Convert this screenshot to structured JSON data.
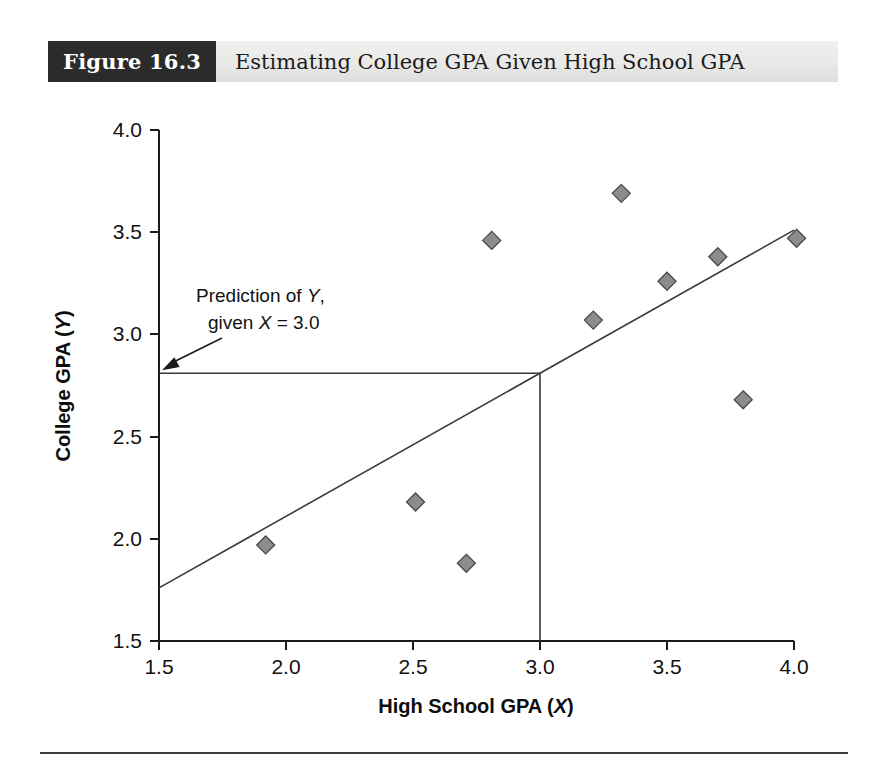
{
  "figure": {
    "number_label": "Figure 16.3",
    "caption": "Estimating College GPA Given High School GPA"
  },
  "colors": {
    "header_block": "#2b2b2b",
    "header_bar": "#e9e9e8",
    "marker_fill": "#8c8c8c",
    "marker_stroke": "#4a4a4a",
    "axis": "#1a1a1a",
    "line": "#3a3a3a"
  },
  "annotation": {
    "line1_prefix": "Prediction of ",
    "line1_italic": "Y",
    "line1_suffix": ",",
    "line2_prefix": "given ",
    "line2_italic": "X",
    "line2_suffix": " = 3.0"
  },
  "chart_data": {
    "type": "scatter",
    "title": "Estimating College GPA Given High School GPA",
    "xlabel_prefix": "High School GPA (",
    "xlabel_italic": "X",
    "xlabel_suffix": ")",
    "ylabel_prefix": "College GPA (",
    "ylabel_italic": "Y",
    "ylabel_suffix": ")",
    "xlim": [
      1.5,
      4.0
    ],
    "ylim": [
      1.5,
      4.0
    ],
    "xticks": [
      "1.5",
      "2.0",
      "2.5",
      "3.0",
      "3.5",
      "4.0"
    ],
    "yticks": [
      "1.5",
      "2.0",
      "2.5",
      "3.0",
      "3.5",
      "4.0"
    ],
    "xtick_values": [
      1.5,
      2.0,
      2.5,
      3.0,
      3.5,
      4.0
    ],
    "ytick_values": [
      1.5,
      2.0,
      2.5,
      3.0,
      3.5,
      4.0
    ],
    "grid": false,
    "legend": "none",
    "points": [
      {
        "x": 1.92,
        "y": 1.97
      },
      {
        "x": 2.51,
        "y": 2.18
      },
      {
        "x": 2.71,
        "y": 1.88
      },
      {
        "x": 2.81,
        "y": 3.46
      },
      {
        "x": 3.21,
        "y": 3.07
      },
      {
        "x": 3.32,
        "y": 3.69
      },
      {
        "x": 3.5,
        "y": 3.26
      },
      {
        "x": 3.7,
        "y": 3.38
      },
      {
        "x": 3.8,
        "y": 2.68
      },
      {
        "x": 4.01,
        "y": 3.47
      }
    ],
    "regression_line": {
      "x1": 1.5,
      "y1": 1.76,
      "x2": 4.0,
      "y2": 3.51
    },
    "prediction": {
      "x_value": 3.0,
      "y_value": 2.81,
      "horizontal_from_x": 1.5,
      "vertical_to_y": 1.5
    }
  }
}
